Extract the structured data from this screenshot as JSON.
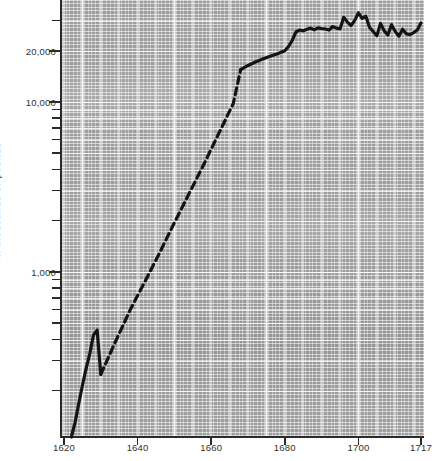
{
  "chart_data": {
    "type": "line",
    "title": "",
    "subtitle": "",
    "xlabel": "",
    "ylabel": "In thousands of pounds",
    "yscale": "log",
    "xlim": [
      1620,
      1717
    ],
    "ylim": [
      100,
      40000
    ],
    "grid": true,
    "legend_position": "none",
    "x_tick_labels": [
      "1620",
      "1640",
      "1660",
      "1680",
      "1700",
      "1717"
    ],
    "x_tick_values": [
      1620,
      1640,
      1660,
      1680,
      1700,
      1717
    ],
    "y_tick_labels": [
      "1,000",
      "10,000",
      "20,000"
    ],
    "y_tick_values": [
      1000,
      10000,
      20000
    ],
    "series": [
      {
        "name": "Trade value",
        "style": "solid",
        "segment": "early-observed",
        "x": [
          1622,
          1623,
          1624,
          1625,
          1626,
          1627,
          1628,
          1629,
          1630
        ],
        "values": [
          105,
          130,
          168,
          215,
          270,
          330,
          425,
          455,
          250
        ]
      },
      {
        "name": "Trade value",
        "style": "dashed",
        "segment": "interpolated",
        "x": [
          1630,
          1634,
          1638,
          1642,
          1646,
          1650,
          1654,
          1658,
          1662,
          1666,
          1668
        ],
        "values": [
          250,
          390,
          600,
          880,
          1300,
          1950,
          2900,
          4300,
          6500,
          9800,
          15500
        ]
      },
      {
        "name": "Trade value",
        "style": "solid",
        "segment": "late-observed",
        "x": [
          1668,
          1670,
          1672,
          1674,
          1676,
          1678,
          1680,
          1681,
          1682,
          1683,
          1684,
          1685,
          1686,
          1687,
          1688,
          1689,
          1690,
          1691,
          1692,
          1693,
          1694,
          1695,
          1696,
          1697,
          1698,
          1699,
          1700,
          1701,
          1702,
          1703,
          1704,
          1705,
          1706,
          1707,
          1708,
          1709,
          1710,
          1711,
          1712,
          1713,
          1714,
          1715,
          1716,
          1717
        ],
        "values": [
          15500,
          16400,
          17200,
          17900,
          18600,
          19200,
          20000,
          21200,
          23000,
          25800,
          26500,
          26200,
          26800,
          27200,
          26600,
          27300,
          27000,
          26900,
          26500,
          27800,
          27200,
          26900,
          31500,
          29500,
          28200,
          30200,
          33500,
          31000,
          32000,
          27500,
          26000,
          24500,
          29000,
          26200,
          24800,
          28500,
          26000,
          24400,
          26800,
          25200,
          24900,
          25600,
          26500,
          29200
        ]
      }
    ]
  },
  "axis": {
    "y_title": "In thousands of pounds",
    "ticks_y": [
      {
        "label": "20,000",
        "value": 20000
      },
      {
        "label": "10,000",
        "value": 10000
      },
      {
        "label": "1,000",
        "value": 1000
      }
    ],
    "ticks_x": [
      {
        "label": "1620",
        "value": 1620
      },
      {
        "label": "1640",
        "value": 1640
      },
      {
        "label": "1660",
        "value": 1660
      },
      {
        "label": "1680",
        "value": 1680
      },
      {
        "label": "1700",
        "value": 1700
      },
      {
        "label": "1717",
        "value": 1717
      }
    ]
  },
  "style": {
    "plot_background": "#9d9d9d",
    "gridline_color": "#ffffff",
    "series_color": "#141414",
    "axis_color": "#2a2a2a",
    "page_background": "#ffffff"
  }
}
